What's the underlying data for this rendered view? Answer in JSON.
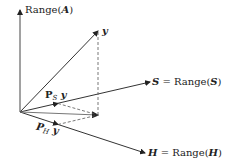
{
  "diagram": {
    "colors": {
      "line": "#333333",
      "dashed": "#555555",
      "background": "#ffffff"
    },
    "labels": {
      "range_a": {
        "pre": "Range(",
        "sym": "A",
        "post": ")"
      },
      "y": "y",
      "s": {
        "sym": "S",
        "eq": " = Range(",
        "sym2": "S",
        "post": ")"
      },
      "h": {
        "sym": "H",
        "eq": " = Range(",
        "sym2": "H",
        "post": ")"
      },
      "ps_y": {
        "p": "P",
        "sub": "S",
        "y": " y"
      },
      "ph_y": {
        "p": "P",
        "sub": "H",
        "y": " y"
      }
    }
  }
}
